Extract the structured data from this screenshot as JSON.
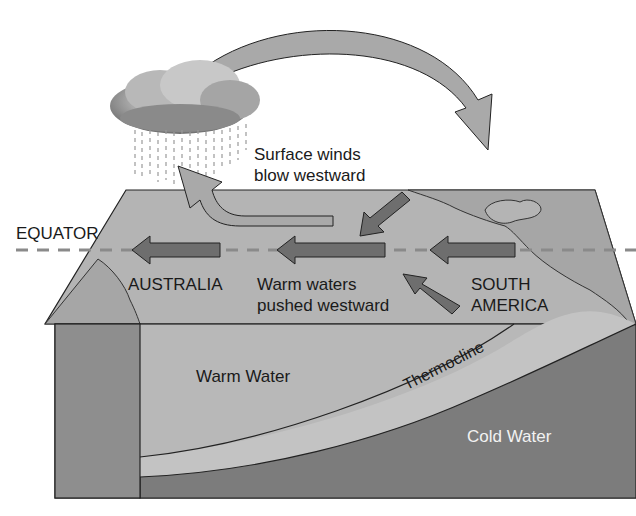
{
  "diagram": {
    "title": "",
    "labels": {
      "surface_winds_line1": "Surface winds",
      "surface_winds_line2": "blow westward",
      "equator": "EQUATOR",
      "australia": "AUSTRALIA",
      "warm_waters_line1": "Warm waters",
      "warm_waters_line2": "pushed westward",
      "south_america_line1": "SOUTH",
      "south_america_line2": "AMERICA",
      "warm_water": "Warm Water",
      "thermocline": "Thermocline",
      "cold_water": "Cold Water"
    },
    "colors": {
      "ocean_surface": "#b4b4b4",
      "land": "#a2a2a2",
      "warm_layer": "#b8b8b8",
      "cold_layer": "#7c7c7c",
      "front_left_block": "#8e8e8e",
      "arrow_dark": "#6e6e6e",
      "arrow_light": "#a9a9a9",
      "equator_line": "#8a8a8a"
    }
  }
}
